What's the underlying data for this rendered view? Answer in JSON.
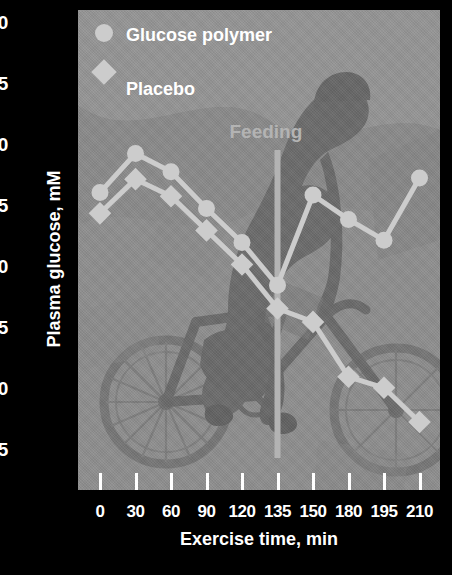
{
  "chart_data": {
    "type": "line",
    "title": "",
    "xlabel": "Exercise time, min",
    "ylabel": "Plasma glucose, mM",
    "categories": [
      "0",
      "30",
      "60",
      "90",
      "120",
      "135",
      "150",
      "180",
      "195",
      "210"
    ],
    "ylim": [
      2.5,
      6.0
    ],
    "yticks": [
      "6.0",
      "5.5",
      "5.0",
      "4.5",
      "4.0",
      "3.5",
      "3.0",
      "2.5"
    ],
    "ytick_values": [
      6.0,
      5.5,
      5.0,
      4.5,
      4.0,
      3.5,
      3.0,
      2.5
    ],
    "grid": false,
    "legend_position": "top-left",
    "series": [
      {
        "name": "Glucose polymer",
        "marker": "circle",
        "color": "#cccccc",
        "values": [
          4.61,
          4.93,
          4.78,
          4.48,
          4.2,
          3.85,
          4.59,
          4.39,
          4.22,
          4.73
        ]
      },
      {
        "name": "Placebo",
        "marker": "diamond",
        "color": "#cccccc",
        "values": [
          4.44,
          4.72,
          4.58,
          4.3,
          4.02,
          3.66,
          3.55,
          3.1,
          3.01,
          2.73
        ]
      }
    ],
    "annotations": [
      {
        "label": "Feeding",
        "type": "vertical-line",
        "at_category": "135",
        "color": "#b3b3b3"
      }
    ]
  },
  "legend": {
    "items": [
      {
        "label": "Glucose polymer",
        "marker": "circle"
      },
      {
        "label": "Placebo",
        "marker": "diamond"
      }
    ]
  },
  "colors": {
    "figure_background": "#000000",
    "panel_background": "#8c8c8c",
    "axis_text": "#ffffff",
    "series_marker": "#cccccc",
    "annotation": "#b3b3b3",
    "watermark": "#6e6e6e"
  }
}
